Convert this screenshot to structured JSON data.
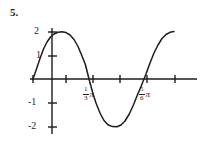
{
  "problem": {
    "number": "5."
  },
  "chart_data": {
    "type": "line",
    "title": "",
    "subtitle": "",
    "xlabel": "",
    "ylabel": "",
    "grid": false,
    "legend": null,
    "function": "y = 2 sin(3x + pi)",
    "amplitude": 2,
    "ylim": [
      -2.4,
      2.4
    ],
    "y_ticks": [
      2,
      1,
      -1,
      -2
    ],
    "y_tick_labels": [
      "2",
      "1",
      "-1",
      "-2"
    ],
    "x_tick_count": 6,
    "x_tick_labels": [
      {
        "num": "1",
        "den": "3",
        "sym": "π"
      },
      {
        "num": "5",
        "den": "6",
        "sym": "π"
      }
    ],
    "zero_crossings": [
      "1/3 pi",
      "5/6 pi"
    ],
    "maxima": [
      2,
      2
    ],
    "minima": [
      -2
    ],
    "curve_color": "#1c1c1c",
    "axis_color": "#1c1c1c",
    "points": [
      [
        33.0,
        79.0
      ],
      [
        36.5,
        69.0
      ],
      [
        40.0,
        58.5
      ],
      [
        43.5,
        49.0
      ],
      [
        47.0,
        42.0
      ],
      [
        50.5,
        37.0
      ],
      [
        54.0,
        34.0
      ],
      [
        58.0,
        32.3
      ],
      [
        62.0,
        31.8
      ],
      [
        66.0,
        32.6
      ],
      [
        70.0,
        35.0
      ],
      [
        74.0,
        39.5
      ],
      [
        78.0,
        46.5
      ],
      [
        82.0,
        56.0
      ],
      [
        85.5,
        65.0
      ],
      [
        89.0,
        79.0
      ],
      [
        92.5,
        92.0
      ],
      [
        96.0,
        103.0
      ],
      [
        100.0,
        113.0
      ],
      [
        104.0,
        120.5
      ],
      [
        108.0,
        124.8
      ],
      [
        112.5,
        126.6
      ],
      [
        117.0,
        126.8
      ],
      [
        121.0,
        125.0
      ],
      [
        125.0,
        121.0
      ],
      [
        129.0,
        114.5
      ],
      [
        133.0,
        106.0
      ],
      [
        137.0,
        96.0
      ],
      [
        141.0,
        86.5
      ],
      [
        146.0,
        74.0
      ],
      [
        150.0,
        63.0
      ],
      [
        154.0,
        53.0
      ],
      [
        158.0,
        45.0
      ],
      [
        162.0,
        38.5
      ],
      [
        166.0,
        34.5
      ],
      [
        170.0,
        32.3
      ],
      [
        174.0,
        31.6
      ]
    ],
    "axis_geometry": {
      "x_axis_y": 79,
      "y_axis_x": 52,
      "x_axis_from": 30,
      "x_axis_to": 197,
      "y_axis_from": 28,
      "y_axis_to": 134,
      "x_tick_positions": [
        33,
        66,
        93,
        120,
        147,
        175
      ],
      "y_tick_positions": [
        32,
        56,
        103,
        127
      ],
      "tick_half_len": 4
    }
  }
}
